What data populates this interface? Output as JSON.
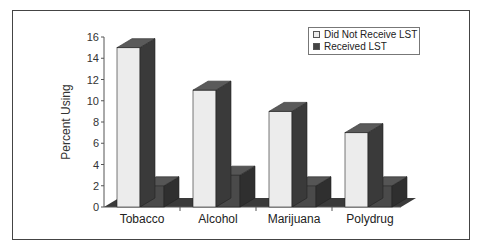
{
  "chart_data": {
    "type": "bar",
    "title": "",
    "xlabel": "",
    "ylabel": "Percent Using",
    "ylim": [
      0,
      16
    ],
    "yticks": [
      0,
      2,
      4,
      6,
      8,
      10,
      12,
      14,
      16
    ],
    "categories": [
      "Tobacco",
      "Alcohol",
      "Marijuana",
      "Polydrug"
    ],
    "series": [
      {
        "name": "Did Not Receive LST",
        "values": [
          15,
          11,
          9,
          7
        ],
        "color": "#e8e8e8"
      },
      {
        "name": "Received LST",
        "values": [
          2,
          3,
          2,
          2
        ],
        "color": "#4a4a4a"
      }
    ],
    "grid": false,
    "legend_position": "upper right",
    "style": "3d"
  }
}
